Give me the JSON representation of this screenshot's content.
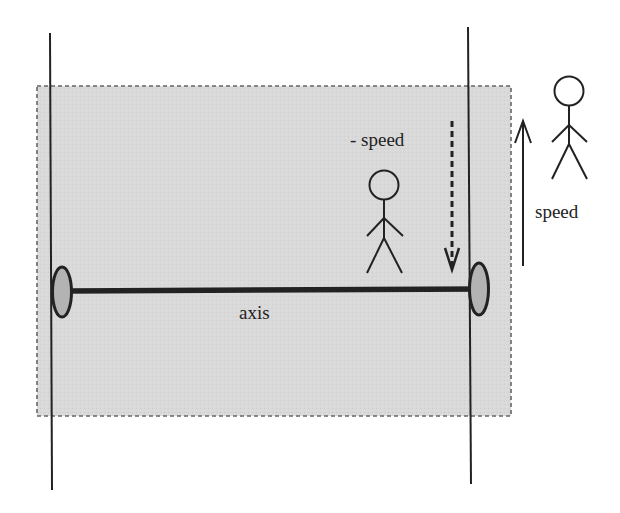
{
  "diagram": {
    "title": "",
    "labels": {
      "neg_speed": "- speed",
      "speed": "speed",
      "axis": "axis"
    },
    "colors": {
      "background": "#ffffff",
      "region_fill": "#d9d9d9",
      "region_border": "#666666",
      "line": "#222222",
      "ellipse_fill": "#b3b3b3"
    },
    "elements": [
      {
        "id": "left-vertical-line",
        "kind": "line"
      },
      {
        "id": "right-vertical-line",
        "kind": "line"
      },
      {
        "id": "shaded-region",
        "kind": "dashed-rectangle"
      },
      {
        "id": "rotation-axis",
        "kind": "thick-line"
      },
      {
        "id": "left-ellipse",
        "kind": "ellipse"
      },
      {
        "id": "right-ellipse",
        "kind": "ellipse"
      },
      {
        "id": "inner-stick-figure",
        "kind": "person"
      },
      {
        "id": "outer-stick-figure",
        "kind": "person"
      },
      {
        "id": "neg-speed-arrow",
        "kind": "dashed-arrow",
        "direction": "down"
      },
      {
        "id": "speed-arrow",
        "kind": "solid-arrow",
        "direction": "up"
      }
    ]
  }
}
